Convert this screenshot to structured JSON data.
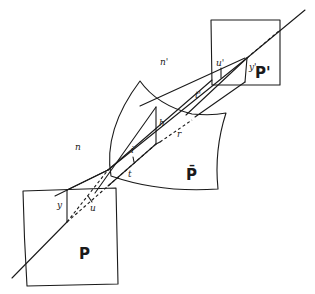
{
  "figure": {
    "type": "optical-refraction-diagram",
    "labels": {
      "object_plane": "P",
      "image_plane": "P'",
      "refracting_surface": "P̄",
      "index_object_space": "n",
      "index_image_space": "n'",
      "object_height": "y",
      "image_height": "y'",
      "object_angle": "u",
      "image_angle": "u'",
      "incidence_height": "h",
      "incidence_angle": "i",
      "object_distance": "t",
      "image_distance": "t'",
      "radius": "r"
    }
  }
}
